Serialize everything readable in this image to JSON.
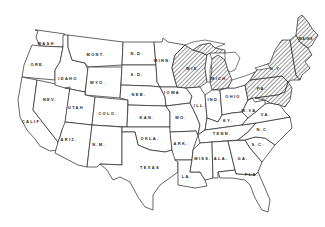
{
  "map": {
    "title": "",
    "region": "United States (contiguous 48 states)",
    "legend": [],
    "hatch_color": "#333333",
    "line_color": "#222222",
    "background": "#ffffff",
    "states": [
      {
        "id": "wash",
        "label": "WASH",
        "hatched": false
      },
      {
        "id": "ore",
        "label": "ORE.",
        "hatched": false
      },
      {
        "id": "calif",
        "label": "CALIF.",
        "hatched": false
      },
      {
        "id": "nev",
        "label": "NEV.",
        "hatched": false
      },
      {
        "id": "idaho",
        "label": "IDAHO",
        "hatched": false
      },
      {
        "id": "mont",
        "label": "MONT.",
        "hatched": false
      },
      {
        "id": "wyo",
        "label": "WYO.",
        "hatched": false
      },
      {
        "id": "utah",
        "label": "UTAH",
        "hatched": false
      },
      {
        "id": "colo",
        "label": "COLO.",
        "hatched": false
      },
      {
        "id": "ariz",
        "label": "ARIZ.",
        "hatched": false
      },
      {
        "id": "nm",
        "label": "N.M.",
        "hatched": false
      },
      {
        "id": "nd",
        "label": "N.D.",
        "hatched": false
      },
      {
        "id": "sd",
        "label": "S.D.",
        "hatched": false
      },
      {
        "id": "neb",
        "label": "NEB.",
        "hatched": false
      },
      {
        "id": "kan",
        "label": "KAN.",
        "hatched": false
      },
      {
        "id": "okla",
        "label": "OKLA.",
        "hatched": false
      },
      {
        "id": "texas",
        "label": "TEXAS",
        "hatched": false
      },
      {
        "id": "minn",
        "label": "MINN.",
        "hatched": false
      },
      {
        "id": "iowa",
        "label": "IOWA",
        "hatched": false
      },
      {
        "id": "mo",
        "label": "MO.",
        "hatched": false
      },
      {
        "id": "ark",
        "label": "ARK.",
        "hatched": false
      },
      {
        "id": "la",
        "label": "LA.",
        "hatched": false
      },
      {
        "id": "wis",
        "label": "WIS.",
        "hatched": true
      },
      {
        "id": "ill",
        "label": "ILL.",
        "hatched": false
      },
      {
        "id": "mich",
        "label": "MICH.",
        "hatched": true
      },
      {
        "id": "ind",
        "label": "IND.",
        "hatched": false
      },
      {
        "id": "ohio",
        "label": "OHIO",
        "hatched": false
      },
      {
        "id": "ky",
        "label": "KY.",
        "hatched": false
      },
      {
        "id": "tenn",
        "label": "TENN.",
        "hatched": false
      },
      {
        "id": "miss",
        "label": "MISS.",
        "hatched": false
      },
      {
        "id": "ala",
        "label": "ALA.",
        "hatched": false
      },
      {
        "id": "ga",
        "label": "GA.",
        "hatched": false
      },
      {
        "id": "fla",
        "label": "FLA.",
        "hatched": false
      },
      {
        "id": "sc",
        "label": "S.C.",
        "hatched": false
      },
      {
        "id": "nc",
        "label": "N.C.",
        "hatched": false
      },
      {
        "id": "va",
        "label": "VA.",
        "hatched": false
      },
      {
        "id": "wva",
        "label": "W.VA.",
        "hatched": false
      },
      {
        "id": "pa",
        "label": "PA.",
        "hatched": true
      },
      {
        "id": "ny",
        "label": "N.Y.",
        "hatched": true
      },
      {
        "id": "maine",
        "label": "MAINE",
        "hatched": true
      },
      {
        "id": "new-england",
        "label": "",
        "hatched": true
      },
      {
        "id": "md-de-nj",
        "label": "",
        "hatched": true
      }
    ]
  }
}
